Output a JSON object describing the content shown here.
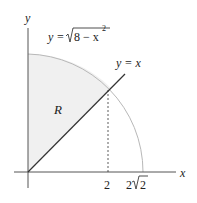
{
  "diagram": {
    "axis_x_label": "x",
    "axis_y_label": "y",
    "curve_label": "y = √(8 − x²)",
    "curve_label_parts": {
      "lhs": "y = ",
      "radical": "√",
      "radicand": "8 − x",
      "exp": "2"
    },
    "line_label": "y = x",
    "region_label": "R",
    "tick_labels": {
      "two": "2",
      "two_root_two_coef": "2",
      "two_root_two_rad": "√",
      "two_root_two_radicand": "2"
    },
    "colors": {
      "region_fill": "#f0f0f0",
      "curve": "#b8b8b8",
      "axes": "#444444",
      "line": "#333333"
    }
  }
}
